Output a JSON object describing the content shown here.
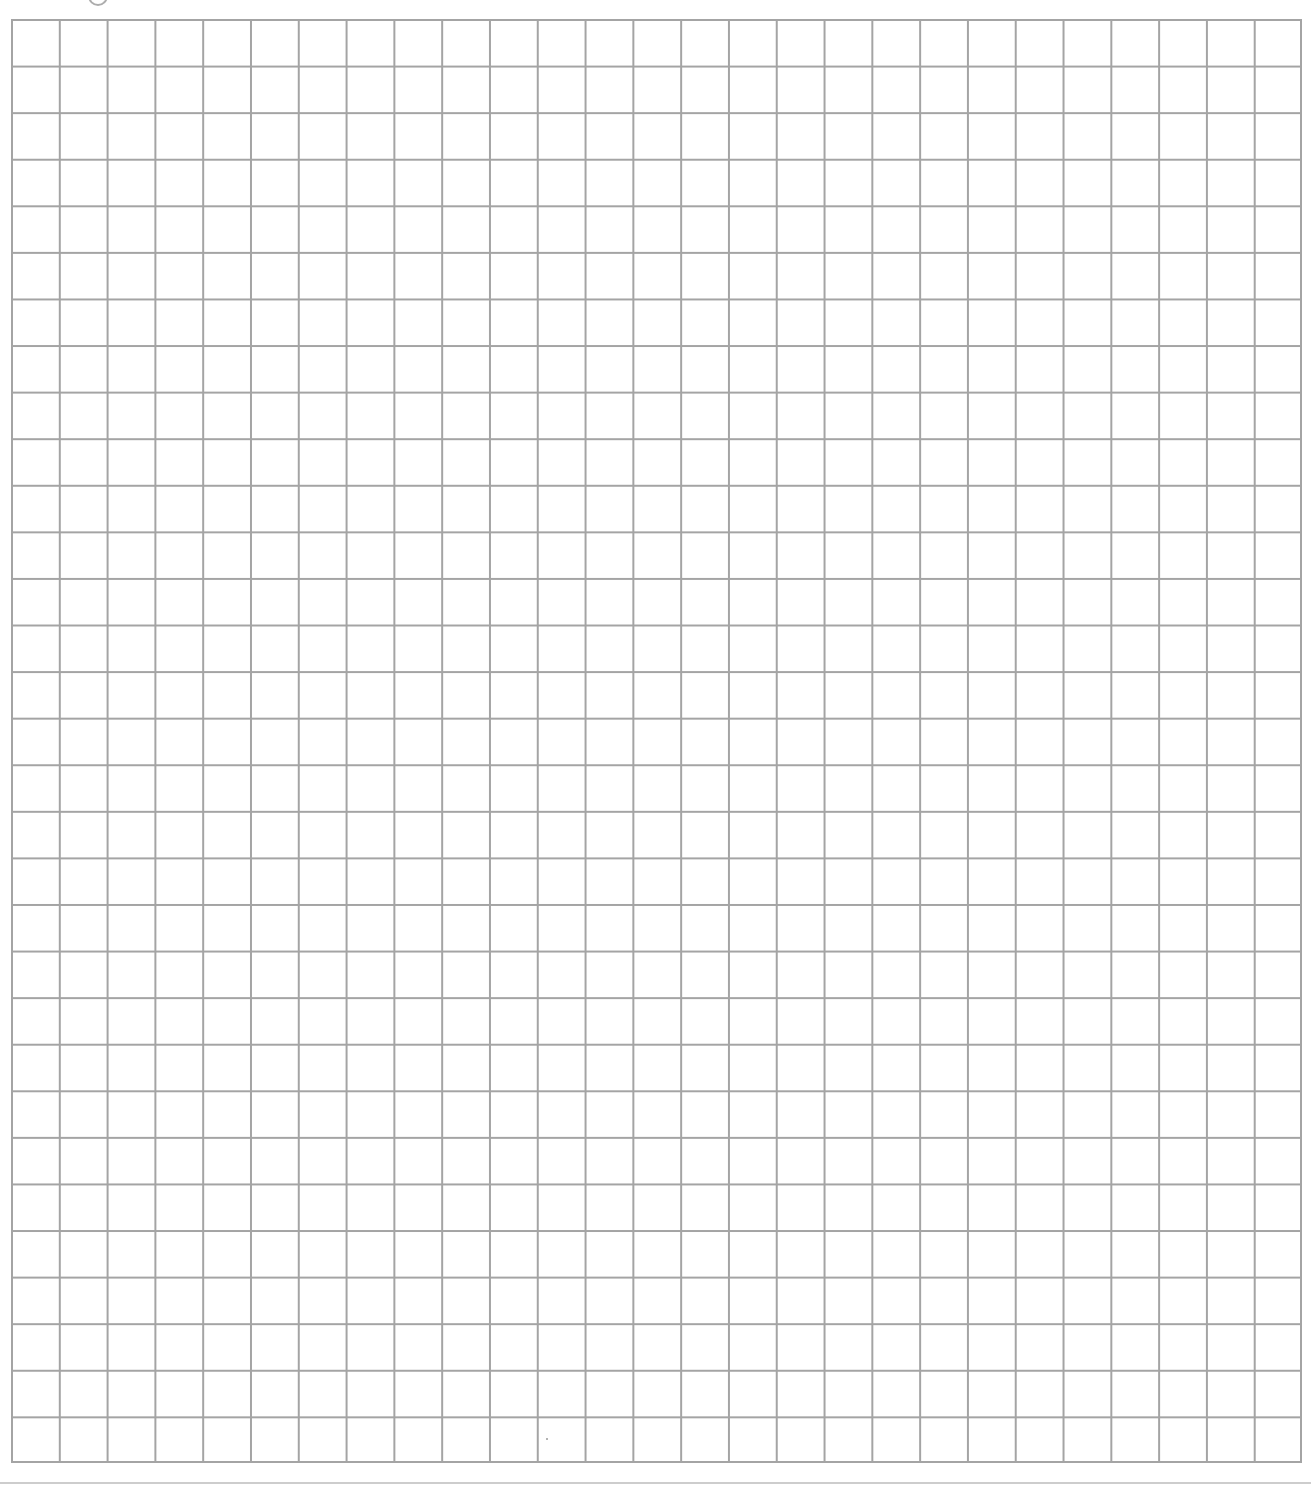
{
  "page": {
    "type": "graph-paper-worksheet",
    "background_color": "#ffffff"
  },
  "grid": {
    "columns": 27,
    "rows": 31,
    "line_color": "#a4a4a4",
    "line_width_px": 2,
    "cell_width_px": 47.8,
    "cell_height_px": 46.58,
    "cells_filled": 0
  }
}
